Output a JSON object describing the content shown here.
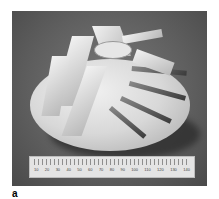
{
  "figure": {
    "label": "a"
  },
  "ruler": {
    "labels": [
      "10",
      "20",
      "30",
      "40",
      "50",
      "60",
      "70",
      "80",
      "90",
      "100",
      "110",
      "120",
      "130",
      "140"
    ]
  }
}
